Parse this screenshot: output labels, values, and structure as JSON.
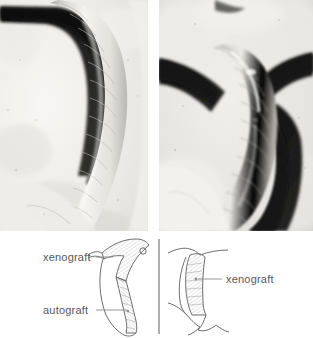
{
  "figure": {
    "kind": "scientific-figure",
    "panel_count": 2,
    "background_color": "#ffffff"
  },
  "photos": {
    "left": {
      "name": "photomicrograph-left",
      "description": "grayscale photomicrograph of curved tubular graft against dark background",
      "tones": {
        "background": "#f2f1ee",
        "dark_field": "#141414",
        "tissue_light": "#f6f5f2",
        "tissue_mid": "#cfcdc8",
        "tissue_shadow": "#9a9791"
      }
    },
    "right": {
      "name": "photomicrograph-right",
      "description": "grayscale photomicrograph of segmented tubular graft bridging two tissue masses",
      "tones": {
        "background": "#e6e5e1",
        "dark_field": "#191919",
        "tissue_light": "#efeeea",
        "tissue_mid": "#c6c4bf",
        "tissue_shadow": "#8f8d88"
      }
    }
  },
  "schematic": {
    "name": "graft-schematic",
    "stroke_color": "#6d6d6f",
    "label_color": "#58585a",
    "divider": {
      "name": "panel-divider",
      "orientation": "vertical"
    },
    "left_diagram": {
      "name": "schematic-left",
      "labels": [
        {
          "id": "xenograft-left",
          "text": "xenograft",
          "leader": "line-to-upper-graft"
        },
        {
          "id": "autograft-left",
          "text": "autograft",
          "leader": "line-to-lower-graft"
        }
      ]
    },
    "right_diagram": {
      "name": "schematic-right",
      "labels": [
        {
          "id": "xenograft-right",
          "text": "xenograft",
          "leader": "line-to-graft"
        }
      ]
    }
  }
}
